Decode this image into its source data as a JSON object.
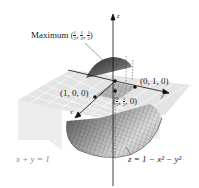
{
  "figure": {
    "type": "3d-surface-diagram",
    "axes": {
      "x": "x",
      "y": "y",
      "z": "z"
    },
    "surface_label": "z = 1 − x² − y²",
    "plane_label": "x + y = 1",
    "maximum": {
      "prefix": "Maximum",
      "point": [
        "1/2",
        "1/2",
        "1/2"
      ],
      "text": "Maximum (1/2, 1/2, 1/2)"
    },
    "points": [
      {
        "id": "p100",
        "label": "(1, 0, 0)"
      },
      {
        "id": "p010",
        "label": "(0, 1, 0)"
      },
      {
        "id": "phalf",
        "label": "(1/2, 1/2, 0)"
      }
    ],
    "colors": {
      "surface_dark": "#3a3a3a",
      "surface_mid": "#8c8c8c",
      "surface_light": "#d8d8d8",
      "plane": "#e6e6e6",
      "grid": "#ffffff",
      "axis": "#111111",
      "gray_label": "#8a8a8a"
    }
  }
}
